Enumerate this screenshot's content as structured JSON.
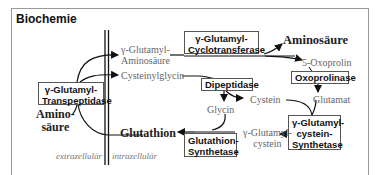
{
  "title": "Biochemie",
  "compartments": {
    "outside": "extrazellulär",
    "inside": "intrazellulär"
  },
  "enzymes": {
    "transpeptidase": {
      "line1": "γ-Glutamyl-",
      "line2": "Transpeptidase"
    },
    "cyclotransferase": {
      "line1": "γ-Glutamyl-",
      "line2": "Cyclotransferase"
    },
    "dipeptidase": {
      "line1": "Dipeptidase"
    },
    "oxoprolinase": {
      "line1": "Oxoprolinase"
    },
    "cysteine_synthetase": {
      "line1": "γ-Glutamyl-",
      "line2": "cystein-",
      "line3": "Synthetase"
    },
    "glutathione_synthetase": {
      "line1": "Glutathion-",
      "line2": "Synthetase"
    }
  },
  "metabolites": {
    "glutamyl_aminoacid": {
      "line1": "γ-Glutamyl-",
      "line2": "Aminosäure"
    },
    "cysteinylglycine": "Cysteinylglycin",
    "aminoacid_right": "Aminosäure",
    "oxoproline": "5-Oxoprolin",
    "glutamate": "Glutamat",
    "cysteine": "Cystein",
    "glycine": "Glycin",
    "glutamylcysteine": {
      "line1": "γ-Glutamyl-",
      "line2": "cystein"
    },
    "glutathione": "Glutathion",
    "aminoacid_left": {
      "line1": "Amino-",
      "line2": "säure"
    }
  },
  "colors": {
    "border": "#9a9a9a",
    "line": "#111111",
    "metabolite_text": "#666666",
    "bold_text": "#222222"
  }
}
